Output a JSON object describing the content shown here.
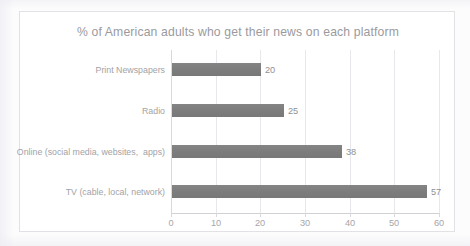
{
  "chart_data": {
    "type": "bar",
    "orientation": "horizontal",
    "title": "% of American adults who get their news on each platform",
    "xlabel": "",
    "ylabel": "",
    "categories": [
      "Print Newspapers",
      "Radio",
      "Online (social media, websites,  apps)",
      "TV (cable, local, network)"
    ],
    "values": [
      20,
      25,
      38,
      57
    ],
    "value_labels": [
      "20",
      "25",
      "38",
      "57"
    ],
    "xlim": [
      0,
      60
    ],
    "xticks": [
      0,
      10,
      20,
      30,
      40,
      50,
      60
    ],
    "xtick_labels": [
      "0",
      "10",
      "20",
      "30",
      "40",
      "50",
      "60"
    ],
    "grid": "vertical",
    "legend": "none",
    "bar_color": "#7F7F7F",
    "gridline_color": "#E8E8EC",
    "title_color": "#9A9A9E",
    "label_color": "#A2A2A6",
    "plot_background": "#FFFFFF",
    "frame_border_color": "#E2E2E6"
  }
}
